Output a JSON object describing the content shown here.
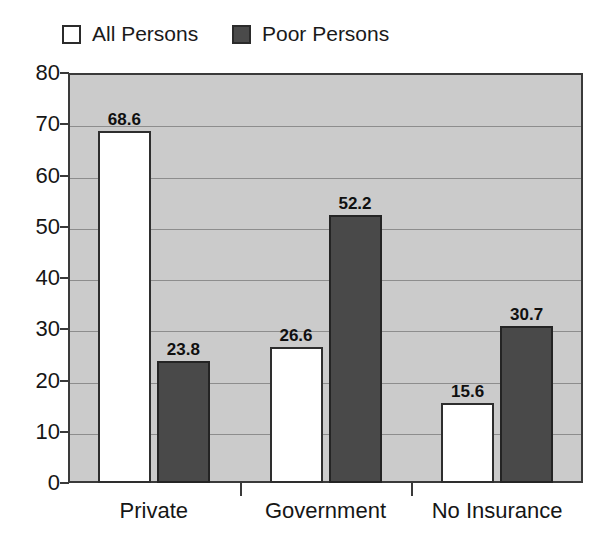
{
  "legend": {
    "entries": [
      {
        "label": "All Persons",
        "swatch": "hollow-square-icon",
        "color": "#ffffff"
      },
      {
        "label": "Poor Persons",
        "swatch": "filled-square-icon",
        "color": "#4a4a4a"
      }
    ]
  },
  "chart_data": {
    "type": "bar",
    "title": "",
    "subtitle": "",
    "xlabel": "",
    "ylabel": "",
    "categories": [
      "Private",
      "Government",
      "No Insurance"
    ],
    "series": [
      {
        "name": "All Persons",
        "values": [
          68.6,
          26.6,
          15.6
        ],
        "color": "#ffffff"
      },
      {
        "name": "Poor Persons",
        "values": [
          23.8,
          52.2,
          30.7
        ],
        "color": "#4a4a4a"
      }
    ],
    "data_labels": [
      "68.6",
      "23.8",
      "26.6",
      "52.2",
      "15.6",
      "30.7"
    ],
    "ylim": [
      0,
      80
    ],
    "yticks": [
      0,
      10,
      20,
      30,
      40,
      50,
      60,
      70,
      80
    ],
    "ytick_labels": [
      "0",
      "10",
      "20",
      "30",
      "40",
      "50",
      "60",
      "70",
      "80"
    ],
    "grid": true,
    "grid_axis": "y",
    "legend_position": "above-plot",
    "plot_background": "#cbcbcb"
  }
}
